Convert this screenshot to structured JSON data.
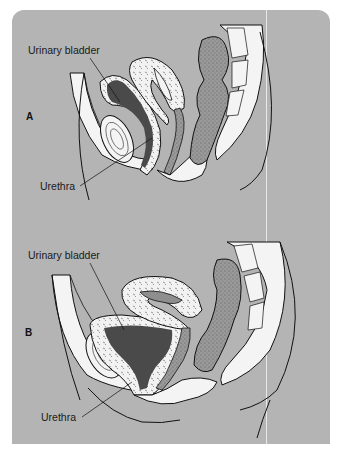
{
  "figure": {
    "colors": {
      "panel_background": "#b4b4b4",
      "tissue_white": "#f4f4f4",
      "bladder_lumen": "#4a4a4a",
      "stippled_tissue": "#8e8e8e",
      "outline": "#111111"
    },
    "panels": [
      {
        "letter": "A",
        "labels": {
          "bladder": "Urinary bladder",
          "urethra": "Urethra"
        }
      },
      {
        "letter": "B",
        "labels": {
          "bladder": "Urinary bladder",
          "urethra": "Urethra"
        }
      }
    ]
  }
}
